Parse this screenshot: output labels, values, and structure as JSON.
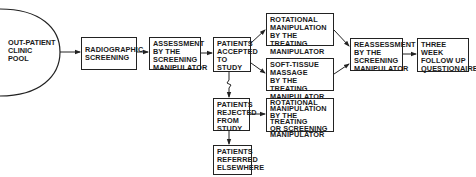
{
  "diagram": {
    "type": "flowchart",
    "nodes": {
      "pool": {
        "label": "OUT-PATIENT\nCLINIC\nPOOL",
        "shape": "half-circle"
      },
      "radiographic": {
        "label": "RADIOGRAPHIC\nSCREENING"
      },
      "assessment": {
        "label": "ASSESSMENT\nBY  THE\nSCREENING\nMANIPULATOR"
      },
      "accepted": {
        "label": "PATIENTS\nACCEPTED\nTO  STUDY"
      },
      "rotational": {
        "label": "ROTATIONAL\nMANIPULATION\nBY  THE  TREATING\nMANIPULATOR"
      },
      "soft_tissue": {
        "label": "SOFT-TISSUE\nMASSAGE\nBY  THE  TREATING\nMANIPULATOR"
      },
      "reassessment": {
        "label": "REASSESSMENT\nBY  THE\nSCREENING\nMANIPULATOR"
      },
      "follow_up": {
        "label": "THREE\nWEEK\nFOLLOW  UP\nQUESTIONAIRE"
      },
      "rejected": {
        "label": "PATIENTS\nREJECTED\nFROM\nSTUDY"
      },
      "rotational_rejected": {
        "label": "ROTATIONAL\nMANIPULATION\nBY  THE  TREATING\nOR  SCREENING\nMANIPULATOR"
      },
      "referred": {
        "label": "PATIENTS\nREFERRED\nELSEWHERE"
      }
    },
    "edges": [
      [
        "pool",
        "radiographic"
      ],
      [
        "radiographic",
        "assessment"
      ],
      [
        "assessment",
        "accepted"
      ],
      [
        "accepted",
        "rotational"
      ],
      [
        "accepted",
        "soft_tissue"
      ],
      [
        "rotational",
        "reassessment"
      ],
      [
        "soft_tissue",
        "reassessment"
      ],
      [
        "reassessment",
        "follow_up"
      ],
      [
        "accepted",
        "rejected"
      ],
      [
        "rejected",
        "rotational_rejected"
      ],
      [
        "rejected",
        "referred"
      ]
    ],
    "colors": {
      "line": "#222222",
      "background": "#ffffff",
      "text": "#1a1a1a"
    }
  }
}
